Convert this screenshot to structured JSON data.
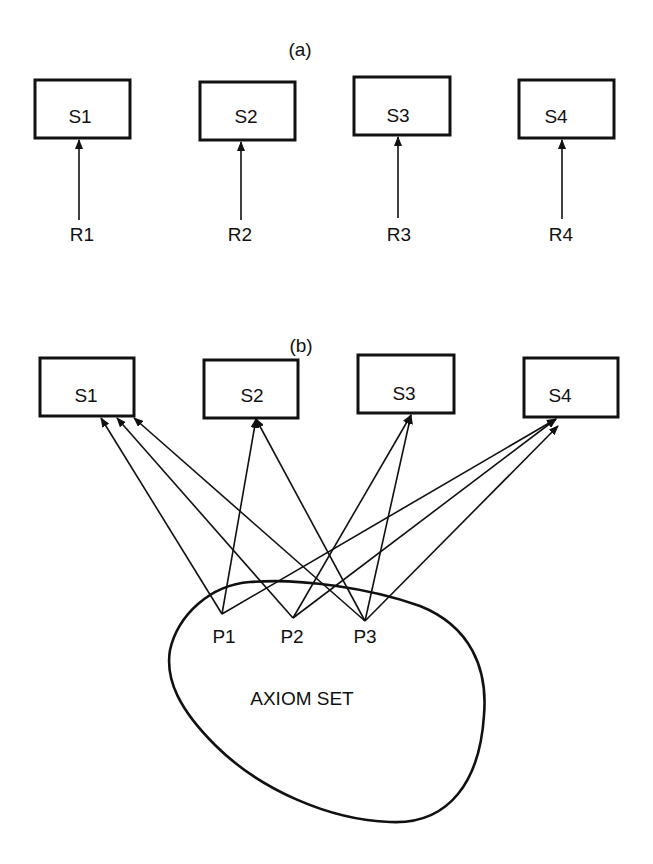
{
  "panel_a": {
    "caption": "(a)",
    "boxes": [
      {
        "label": "S1",
        "x": 35,
        "y": 80,
        "w": 95,
        "h": 58,
        "arrow_x": 79,
        "source": "R1"
      },
      {
        "label": "S2",
        "x": 200,
        "y": 82,
        "w": 95,
        "h": 58,
        "arrow_x": 241,
        "source": "R2"
      },
      {
        "label": "S3",
        "x": 354,
        "y": 77,
        "w": 96,
        "h": 58,
        "arrow_x": 398,
        "source": "R3"
      },
      {
        "label": "S4",
        "x": 519,
        "y": 80,
        "w": 95,
        "h": 58,
        "arrow_x": 562,
        "source": "R4"
      }
    ],
    "sources": [
      "R1",
      "R2",
      "R3",
      "R4"
    ]
  },
  "panel_b": {
    "caption": "(b)",
    "boxes": [
      {
        "label": "S1",
        "x": 40,
        "y": 358,
        "w": 94,
        "h": 58
      },
      {
        "label": "S2",
        "x": 204,
        "y": 360,
        "w": 94,
        "h": 58
      },
      {
        "label": "S3",
        "x": 358,
        "y": 355,
        "w": 96,
        "h": 58
      },
      {
        "label": "S4",
        "x": 524,
        "y": 358,
        "w": 94,
        "h": 59
      }
    ],
    "premises": [
      {
        "label": "P1",
        "x": 222,
        "y": 614
      },
      {
        "label": "P2",
        "x": 293,
        "y": 618
      },
      {
        "label": "P3",
        "x": 365,
        "y": 621
      }
    ],
    "connections": [
      {
        "from": "P1",
        "to": "S1"
      },
      {
        "from": "P1",
        "to": "S2"
      },
      {
        "from": "P1",
        "to": "S4"
      },
      {
        "from": "P2",
        "to": "S1"
      },
      {
        "from": "P2",
        "to": "S3"
      },
      {
        "from": "P2",
        "to": "S4"
      },
      {
        "from": "P3",
        "to": "S1"
      },
      {
        "from": "P3",
        "to": "S2"
      },
      {
        "from": "P3",
        "to": "S3"
      },
      {
        "from": "P3",
        "to": "S4"
      }
    ],
    "set_label": "AXIOM SET"
  }
}
